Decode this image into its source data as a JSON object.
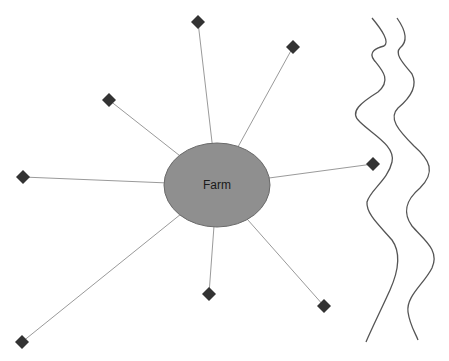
{
  "diagram": {
    "center": {
      "label": "Farm",
      "cx": 217,
      "cy": 185,
      "rx": 53,
      "ry": 42,
      "fill": "#8f8f8f",
      "stroke": "#6a6a6a"
    },
    "connector_color": "#9a9a9a",
    "node_color": "#333333",
    "nodes": [
      {
        "id": "n1",
        "x": 198,
        "y": 22
      },
      {
        "id": "n2",
        "x": 293,
        "y": 47
      },
      {
        "id": "n3",
        "x": 109,
        "y": 100
      },
      {
        "id": "n4",
        "x": 23,
        "y": 177
      },
      {
        "id": "n5",
        "x": 373,
        "y": 164
      },
      {
        "id": "n6",
        "x": 209,
        "y": 294
      },
      {
        "id": "n7",
        "x": 324,
        "y": 306
      },
      {
        "id": "n8",
        "x": 22,
        "y": 342
      }
    ],
    "river": {
      "color": "#555555",
      "banks": [
        "M372,18 C382,30 390,42 384,46 C376,48 368,52 374,60 C382,70 392,80 378,92 C362,102 348,112 360,122 C372,134 396,146 392,162 C388,180 370,190 367,202 C366,214 380,226 392,240 C402,254 398,272 390,290 C380,312 372,328 366,342",
        "M397,18 C404,28 410,40 400,48 C394,54 404,64 412,74 C418,86 410,98 398,108 C388,118 398,130 414,146 C430,160 436,172 420,188 C406,200 402,212 412,226 C424,240 440,250 432,268 C424,284 406,296 408,312 C410,326 416,334 418,340"
      ]
    }
  }
}
